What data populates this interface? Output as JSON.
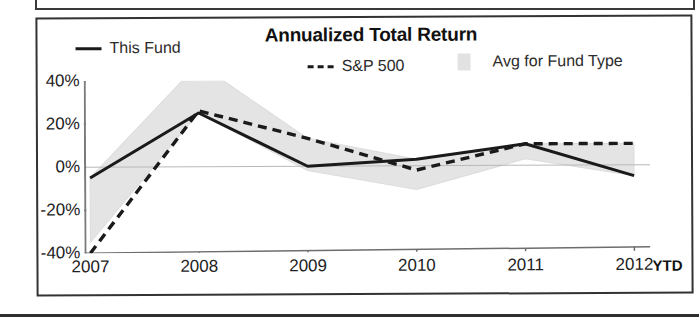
{
  "chart_data": {
    "type": "line",
    "title": "Annualized Total Return",
    "xlabel": "",
    "ylabel": "",
    "x": [
      "2007",
      "2008",
      "2009",
      "2010",
      "2011",
      "2012"
    ],
    "categories": [
      "2007",
      "2008",
      "2009",
      "2010",
      "2011",
      "2012"
    ],
    "ylim": [
      -40,
      40
    ],
    "yticks": [
      40,
      20,
      0,
      -20,
      -40
    ],
    "ytick_labels": [
      "40%",
      "20%",
      "0%",
      "-20%",
      "-40%"
    ],
    "grid": false,
    "legend_position": "top",
    "x_suffix_note": "YTD",
    "series": [
      {
        "name": "This Fund",
        "style": "solid",
        "color": "#1a1a1a",
        "values": [
          -5,
          25,
          0,
          3,
          10,
          -5
        ]
      },
      {
        "name": "S&P 500",
        "style": "dashed",
        "color": "#1a1a1a",
        "values": [
          -40,
          26,
          13,
          -2,
          10,
          10
        ]
      },
      {
        "name": "Avg for Fund Type",
        "style": "band",
        "color": "#e2e2e2",
        "upper": [
          -5,
          48,
          13,
          3,
          10,
          10
        ],
        "lower": [
          -35,
          25,
          -2,
          -11,
          3,
          -5
        ]
      }
    ]
  },
  "chart": {
    "title": "Annualized Total Return",
    "ytd_label": "YTD",
    "legend": [
      {
        "label": "This Fund",
        "marker": "solid-line"
      },
      {
        "label": "S&P 500",
        "marker": "dashed-line"
      },
      {
        "label": "Avg for Fund Type",
        "marker": "area-swatch"
      }
    ],
    "y_ticks": [
      "40%",
      "20%",
      "0%",
      "-20%",
      "-40%"
    ],
    "x_ticks": [
      "2007",
      "2008",
      "2009",
      "2010",
      "2011",
      "2012"
    ]
  }
}
